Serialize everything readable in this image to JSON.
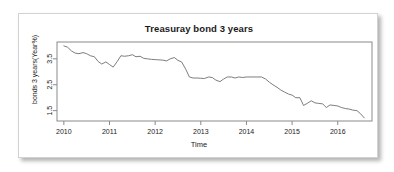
{
  "card": {
    "background": "#ffffff",
    "border_color": "#d2d2d2"
  },
  "chart_data": {
    "type": "line",
    "title": "Treasuray bond 3 years",
    "xlabel": "Time",
    "ylabel": "bonds 3 years(Year%)",
    "grid": false,
    "legend": "none",
    "line_color": "#6e6e6e",
    "axis_color": "#8a8a8a",
    "xlim": [
      2009.85,
      2016.75
    ],
    "ylim": [
      1.1,
      4.15
    ],
    "xticks": [
      2010,
      2011,
      2012,
      2013,
      2014,
      2015,
      2016
    ],
    "xticklabels": [
      "2010",
      "2011",
      "2012",
      "2013",
      "2014",
      "2015",
      "2016"
    ],
    "yticks": [
      1.5,
      2.5,
      3.5
    ],
    "yticklabels": [
      "1.5",
      "2.5",
      "3.5"
    ],
    "x": [
      2010.0,
      2010.08,
      2010.17,
      2010.25,
      2010.33,
      2010.42,
      2010.5,
      2010.58,
      2010.67,
      2010.75,
      2010.83,
      2010.92,
      2011.0,
      2011.08,
      2011.17,
      2011.25,
      2011.33,
      2011.42,
      2011.5,
      2011.58,
      2011.67,
      2011.75,
      2011.83,
      2011.92,
      2012.0,
      2012.08,
      2012.17,
      2012.25,
      2012.33,
      2012.42,
      2012.5,
      2012.58,
      2012.67,
      2012.75,
      2012.83,
      2012.92,
      2013.0,
      2013.08,
      2013.17,
      2013.25,
      2013.33,
      2013.42,
      2013.5,
      2013.58,
      2013.67,
      2013.75,
      2013.83,
      2013.92,
      2014.0,
      2014.08,
      2014.17,
      2014.25,
      2014.33,
      2014.42,
      2014.5,
      2014.58,
      2014.67,
      2014.75,
      2014.83,
      2014.92,
      2015.0,
      2015.08,
      2015.17,
      2015.25,
      2015.33,
      2015.42,
      2015.5,
      2015.58,
      2015.67,
      2015.75,
      2015.83,
      2015.92,
      2016.0,
      2016.08,
      2016.17,
      2016.25,
      2016.33,
      2016.42,
      2016.5,
      2016.58
    ],
    "y": [
      4.0,
      3.95,
      3.8,
      3.72,
      3.7,
      3.74,
      3.7,
      3.62,
      3.58,
      3.4,
      3.3,
      3.38,
      3.28,
      3.18,
      3.4,
      3.62,
      3.6,
      3.62,
      3.66,
      3.58,
      3.6,
      3.52,
      3.5,
      3.48,
      3.47,
      3.46,
      3.45,
      3.42,
      3.5,
      3.55,
      3.44,
      3.38,
      3.1,
      2.8,
      2.76,
      2.76,
      2.75,
      2.74,
      2.8,
      2.78,
      2.68,
      2.62,
      2.72,
      2.8,
      2.8,
      2.76,
      2.8,
      2.78,
      2.8,
      2.8,
      2.8,
      2.8,
      2.8,
      2.72,
      2.6,
      2.5,
      2.4,
      2.3,
      2.22,
      2.14,
      2.1,
      2.0,
      2.0,
      1.7,
      1.78,
      1.88,
      1.8,
      1.78,
      1.76,
      1.62,
      1.72,
      1.7,
      1.68,
      1.62,
      1.58,
      1.56,
      1.52,
      1.5,
      1.38,
      1.22
    ]
  }
}
